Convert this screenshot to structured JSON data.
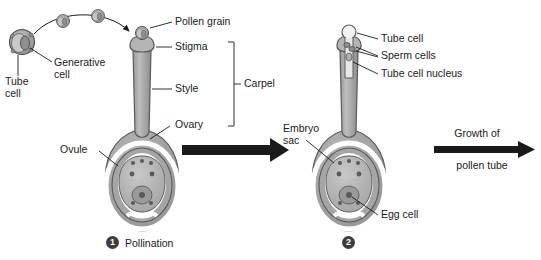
{
  "diagram": {
    "colors": {
      "carpel_fill": "#a8a8a8",
      "carpel_fill_light": "#c0c0c0",
      "carpel_stroke": "#5a5a5a",
      "ovule_fill": "#9a9a9a",
      "embryo_sac_fill": "#b5b5b5",
      "white_gap": "#ffffff",
      "pollen_fill": "#9e9e9e",
      "pollen_stroke": "#4a4a4a",
      "arrow_black": "#1a1a1a",
      "badge_fill": "#3d3d3d",
      "text": "#1a1a1a",
      "leader_line": "#1a1a1a"
    }
  },
  "labels": {
    "pollen_grain": "Pollen grain",
    "generative_cell_line1": "Generative",
    "generative_cell_line2": "cell",
    "tube_cell_left_line1": "Tube",
    "tube_cell_left_line2": "cell",
    "stigma": "Stigma",
    "style": "Style",
    "ovary": "Ovary",
    "carpel": "Carpel",
    "ovule": "Ovule",
    "tube_cell": "Tube cell",
    "sperm_cells": "Sperm cells",
    "tube_cell_nucleus": "Tube cell nucleus",
    "embryo_sac_line1": "Embryo",
    "embryo_sac_line2": "sac",
    "egg_cell": "Egg cell"
  },
  "steps": [
    {
      "number": "1",
      "caption": "Pollination"
    },
    {
      "number": "2",
      "caption": ""
    }
  ],
  "process_arrow": {
    "line1": "Growth of",
    "line2": "pollen tube"
  }
}
